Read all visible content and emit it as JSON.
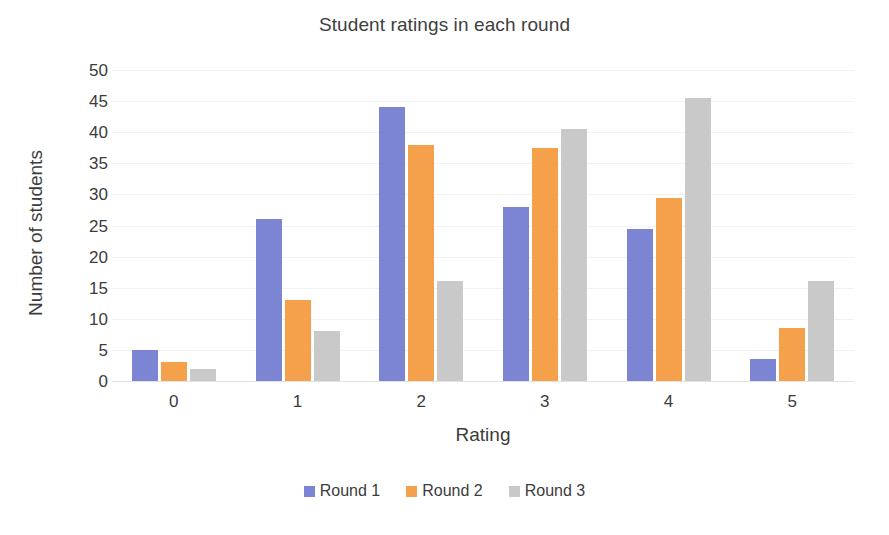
{
  "chart_data": {
    "type": "bar",
    "title": "Student ratings in each round",
    "xlabel": "Rating",
    "ylabel": "Number of students",
    "categories": [
      "0",
      "1",
      "2",
      "3",
      "4",
      "5"
    ],
    "series": [
      {
        "name": "Round 1",
        "color": "#7b85d4",
        "values": [
          5,
          26,
          44,
          28,
          24.5,
          3.5
        ]
      },
      {
        "name": "Round 2",
        "color": "#f5a04a",
        "values": [
          3,
          13,
          38,
          37.5,
          29.5,
          8.5
        ]
      },
      {
        "name": "Round 3",
        "color": "#c9c9c9",
        "values": [
          2,
          8,
          16,
          40.5,
          45.5,
          16
        ]
      }
    ],
    "ylim": [
      0,
      50
    ],
    "ytick_step": 5,
    "yticks": [
      "50",
      "45",
      "40",
      "35",
      "30",
      "25",
      "20",
      "15",
      "10",
      "5",
      "0"
    ],
    "grid": true,
    "legend_position": "bottom"
  }
}
